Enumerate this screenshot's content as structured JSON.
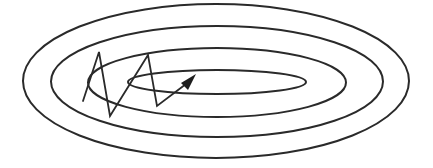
{
  "diagram": {
    "colors": {
      "background": "#ffffff",
      "stroke": "#2a2a2a",
      "arrow_fill": "#1e1e1e"
    },
    "contours": [
      {
        "name": "contour-outer",
        "level": 4
      },
      {
        "name": "contour-third",
        "level": 3
      },
      {
        "name": "contour-second",
        "level": 2
      },
      {
        "name": "contour-inner",
        "level": 1
      }
    ],
    "optimization_path": {
      "description": "zigzag descent path with steps oscillating across the narrow axis, ending in an arrow pointing toward the minimum",
      "step_count": 5,
      "ends_with_arrow": true
    }
  }
}
